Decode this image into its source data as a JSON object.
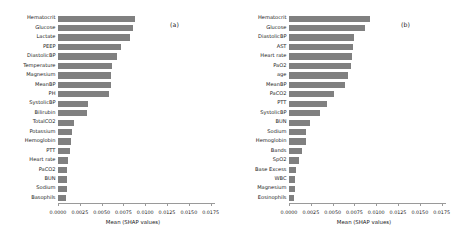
{
  "figure": {
    "panels": [
      {
        "tag": "(a)",
        "xlabel": "Mean (SHAP values)",
        "features": [
          {
            "label": "Hematocrit",
            "value": 0.0088
          },
          {
            "label": "Glucose",
            "value": 0.0086
          },
          {
            "label": "Lactate",
            "value": 0.0082
          },
          {
            "label": "PEEP",
            "value": 0.0072
          },
          {
            "label": "DiastolicBP",
            "value": 0.0068
          },
          {
            "label": "Temperature",
            "value": 0.0062
          },
          {
            "label": "Magnesium",
            "value": 0.0061
          },
          {
            "label": "MeanBP",
            "value": 0.0061
          },
          {
            "label": "PH",
            "value": 0.0059
          },
          {
            "label": "SystolicBP",
            "value": 0.0034
          },
          {
            "label": "Bilirubin",
            "value": 0.0033
          },
          {
            "label": "TotalCO2",
            "value": 0.0018
          },
          {
            "label": "Potassium",
            "value": 0.0016
          },
          {
            "label": "Hemoglobin",
            "value": 0.0015
          },
          {
            "label": "PTT",
            "value": 0.0014
          },
          {
            "label": "Heart rate",
            "value": 0.0011
          },
          {
            "label": "PaCO2",
            "value": 0.001
          },
          {
            "label": "BUN",
            "value": 0.001
          },
          {
            "label": "Sodium",
            "value": 0.001
          },
          {
            "label": "Basophils",
            "value": 0.0009
          }
        ]
      },
      {
        "tag": "(b)",
        "xlabel": "Mean (SHAP values)",
        "features": [
          {
            "label": "Hematocrit",
            "value": 0.0093
          },
          {
            "label": "Glucose",
            "value": 0.0087
          },
          {
            "label": "DiastolicBP",
            "value": 0.0074
          },
          {
            "label": "AST",
            "value": 0.0073
          },
          {
            "label": "Heart rate",
            "value": 0.0072
          },
          {
            "label": "PaO2",
            "value": 0.0071
          },
          {
            "label": "age",
            "value": 0.0068
          },
          {
            "label": "MeanBP",
            "value": 0.0064
          },
          {
            "label": "PaCO2",
            "value": 0.0052
          },
          {
            "label": "PTT",
            "value": 0.0044
          },
          {
            "label": "SystolicBP",
            "value": 0.0036
          },
          {
            "label": "BUN",
            "value": 0.0024
          },
          {
            "label": "Sodium",
            "value": 0.002
          },
          {
            "label": "Hemoglobin",
            "value": 0.0019
          },
          {
            "label": "Bands",
            "value": 0.0015
          },
          {
            "label": "SpO2",
            "value": 0.0011
          },
          {
            "label": "Base Excess",
            "value": 0.0008
          },
          {
            "label": "WBC",
            "value": 0.0007
          },
          {
            "label": "Magnesium",
            "value": 0.0007
          },
          {
            "label": "Eosinophils",
            "value": 0.0006
          }
        ]
      }
    ],
    "xticks": [
      "0.0000",
      "0.0025",
      "0.0050",
      "0.0075",
      "0.0100",
      "0.0125",
      "0.0150",
      "0.0175"
    ],
    "xtick_values": [
      0.0,
      0.0025,
      0.005,
      0.0075,
      0.01,
      0.0125,
      0.015,
      0.0175
    ],
    "xlim": [
      0,
      0.018
    ],
    "bar_color": "#808080"
  },
  "chart_data": {
    "type": "bar",
    "title": "",
    "orientation": "horizontal",
    "xlabel": "Mean (SHAP values)",
    "ylabel": "",
    "xlim": [
      0,
      0.018
    ],
    "grid": false,
    "legend": "none",
    "panels": [
      {
        "name": "(a)",
        "categories": [
          "Hematocrit",
          "Glucose",
          "Lactate",
          "PEEP",
          "DiastolicBP",
          "Temperature",
          "Magnesium",
          "MeanBP",
          "PH",
          "SystolicBP",
          "Bilirubin",
          "TotalCO2",
          "Potassium",
          "Hemoglobin",
          "PTT",
          "Heart rate",
          "PaCO2",
          "BUN",
          "Sodium",
          "Basophils"
        ],
        "values": [
          0.0088,
          0.0086,
          0.0082,
          0.0072,
          0.0068,
          0.0062,
          0.0061,
          0.0061,
          0.0059,
          0.0034,
          0.0033,
          0.0018,
          0.0016,
          0.0015,
          0.0014,
          0.0011,
          0.001,
          0.001,
          0.001,
          0.0009
        ]
      },
      {
        "name": "(b)",
        "categories": [
          "Hematocrit",
          "Glucose",
          "DiastolicBP",
          "AST",
          "Heart rate",
          "PaO2",
          "age",
          "MeanBP",
          "PaCO2",
          "PTT",
          "SystolicBP",
          "BUN",
          "Sodium",
          "Hemoglobin",
          "Bands",
          "SpO2",
          "Base Excess",
          "WBC",
          "Magnesium",
          "Eosinophils"
        ],
        "values": [
          0.0093,
          0.0087,
          0.0074,
          0.0073,
          0.0072,
          0.0071,
          0.0068,
          0.0064,
          0.0052,
          0.0044,
          0.0036,
          0.0024,
          0.002,
          0.0019,
          0.0015,
          0.0011,
          0.0008,
          0.0007,
          0.0007,
          0.0006
        ]
      }
    ]
  }
}
